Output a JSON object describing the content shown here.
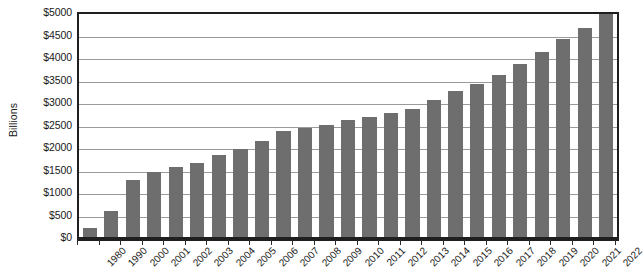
{
  "chart_data": {
    "type": "bar",
    "title": "",
    "xlabel": "",
    "ylabel": "Billions",
    "ylim": [
      0,
      5000
    ],
    "ytick_step": 500,
    "grid": true,
    "legend": "none",
    "bar_color": "#6e6e6e",
    "axis_color": "#1f1f1f",
    "gridline_color": "#9a9a9a",
    "ytick_labels": [
      "$5000",
      "$4500",
      "$4000",
      "$3500",
      "$3000",
      "$2500",
      "$2000",
      "$1500",
      "$1000",
      "$500",
      "$0"
    ],
    "ytick_values": [
      5000,
      4500,
      4000,
      3500,
      3000,
      2500,
      2000,
      1500,
      1000,
      500,
      0
    ],
    "categories": [
      "1980",
      "1990",
      "2000",
      "2001",
      "2002",
      "2003",
      "2004",
      "2005",
      "2006",
      "2007",
      "2008",
      "2009",
      "2010",
      "2011",
      "2012",
      "2013",
      "2014",
      "2015",
      "2016",
      "2017",
      "2018",
      "2019",
      "2020",
      "2021",
      "2022"
    ],
    "values": [
      245,
      620,
      1320,
      1480,
      1610,
      1700,
      1860,
      1990,
      2180,
      2400,
      2460,
      2530,
      2650,
      2720,
      2810,
      2890,
      3100,
      3300,
      3450,
      3650,
      3900,
      4150,
      4450,
      4700,
      5000
    ]
  }
}
